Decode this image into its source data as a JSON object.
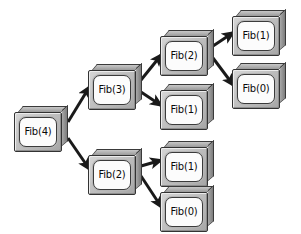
{
  "diagram": {
    "type": "tree",
    "background_color": "#ffffff",
    "node_fill_color": "#c0c0c0",
    "node_plate_color": "#fcfcfc",
    "node_border_color": "#333333",
    "edge_color": "#1a1a1a",
    "canvas": {
      "width": 301,
      "height": 234
    }
  },
  "nodes": [
    {
      "id": "fib4",
      "label": "Fib(4)",
      "x": 14,
      "y": 106,
      "w": 54,
      "h": 46
    },
    {
      "id": "fib3",
      "label": "Fib(3)",
      "x": 88,
      "y": 64,
      "w": 54,
      "h": 46
    },
    {
      "id": "fib2a",
      "label": "Fib(2)",
      "x": 160,
      "y": 30,
      "w": 54,
      "h": 46
    },
    {
      "id": "fib1a",
      "label": "Fib(1)",
      "x": 160,
      "y": 84,
      "w": 54,
      "h": 46
    },
    {
      "id": "fib1b",
      "label": "Fib(1)",
      "x": 232,
      "y": 10,
      "w": 54,
      "h": 46
    },
    {
      "id": "fib0a",
      "label": "Fib(0)",
      "x": 232,
      "y": 63,
      "w": 54,
      "h": 46
    },
    {
      "id": "fib2b",
      "label": "Fib(2)",
      "x": 88,
      "y": 149,
      "w": 54,
      "h": 46
    },
    {
      "id": "fib1c",
      "label": "Fib(1)",
      "x": 160,
      "y": 141,
      "w": 54,
      "h": 46
    },
    {
      "id": "fib0b",
      "label": "Fib(0)",
      "x": 160,
      "y": 186,
      "w": 54,
      "h": 46
    }
  ],
  "edges": [
    {
      "id": "e1",
      "from": "fib4",
      "to": "fib3",
      "x1": 68,
      "y1": 122,
      "x2": 90,
      "y2": 86
    },
    {
      "id": "e2",
      "from": "fib4",
      "to": "fib2b",
      "x1": 68,
      "y1": 138,
      "x2": 90,
      "y2": 170
    },
    {
      "id": "e3",
      "from": "fib3",
      "to": "fib2a",
      "x1": 141,
      "y1": 80,
      "x2": 162,
      "y2": 54
    },
    {
      "id": "e4",
      "from": "fib3",
      "to": "fib1a",
      "x1": 141,
      "y1": 92,
      "x2": 162,
      "y2": 106
    },
    {
      "id": "e5",
      "from": "fib2a",
      "to": "fib1b",
      "x1": 213,
      "y1": 46,
      "x2": 234,
      "y2": 32
    },
    {
      "id": "e6",
      "from": "fib2a",
      "to": "fib0a",
      "x1": 213,
      "y1": 58,
      "x2": 234,
      "y2": 86
    },
    {
      "id": "e7",
      "from": "fib2b",
      "to": "fib1c",
      "x1": 141,
      "y1": 166,
      "x2": 162,
      "y2": 160
    },
    {
      "id": "e8",
      "from": "fib2b",
      "to": "fib0b",
      "x1": 141,
      "y1": 176,
      "x2": 162,
      "y2": 208
    }
  ],
  "chart_data": {
    "type": "tree",
    "root": "Fib(4)",
    "nodes": [
      "Fib(4)",
      "Fib(3)",
      "Fib(2)",
      "Fib(1)",
      "Fib(1)",
      "Fib(0)",
      "Fib(2)",
      "Fib(1)",
      "Fib(0)"
    ],
    "edges": [
      [
        "Fib(4)",
        "Fib(3)"
      ],
      [
        "Fib(4)",
        "Fib(2)"
      ],
      [
        "Fib(3)",
        "Fib(2)"
      ],
      [
        "Fib(3)",
        "Fib(1)"
      ],
      [
        "Fib(2)",
        "Fib(1)"
      ],
      [
        "Fib(2)",
        "Fib(0)"
      ],
      [
        "Fib(2)",
        "Fib(1)"
      ],
      [
        "Fib(2)",
        "Fib(0)"
      ]
    ],
    "levels": [
      {
        "depth": 0,
        "labels": [
          "Fib(4)"
        ]
      },
      {
        "depth": 1,
        "labels": [
          "Fib(3)",
          "Fib(2)"
        ]
      },
      {
        "depth": 2,
        "labels": [
          "Fib(2)",
          "Fib(1)",
          "Fib(1)",
          "Fib(0)"
        ]
      },
      {
        "depth": 3,
        "labels": [
          "Fib(1)",
          "Fib(0)"
        ]
      }
    ]
  }
}
